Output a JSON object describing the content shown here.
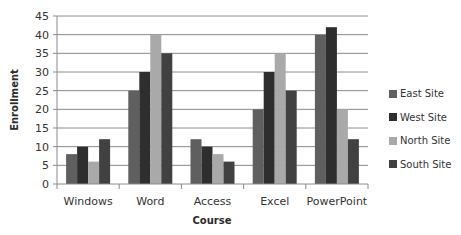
{
  "chart_data": {
    "type": "bar",
    "title": "",
    "xlabel": "Course",
    "ylabel": "Enrollment",
    "ylim": [
      0,
      45
    ],
    "yticks": [
      0,
      5,
      10,
      15,
      20,
      25,
      30,
      35,
      40,
      45
    ],
    "grid": true,
    "legend_position": "right",
    "categories": [
      "Windows",
      "Word",
      "Access",
      "Excel",
      "PowerPoint"
    ],
    "series": [
      {
        "name": "East Site",
        "color": "#5f5f5f",
        "values": [
          8,
          25,
          12,
          20,
          40
        ]
      },
      {
        "name": "West Site",
        "color": "#2e2e2e",
        "values": [
          10,
          30,
          10,
          30,
          42
        ]
      },
      {
        "name": "North Site",
        "color": "#a9a9a9",
        "values": [
          6,
          40,
          8,
          35,
          20
        ]
      },
      {
        "name": "South Site",
        "color": "#414141",
        "values": [
          12,
          35,
          6,
          25,
          12
        ]
      }
    ]
  }
}
